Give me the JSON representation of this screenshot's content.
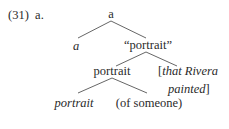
{
  "example": {
    "number": "(31)",
    "sub_label": "a."
  },
  "tree": {
    "root": {
      "label": "a",
      "italic": false
    },
    "level1": {
      "left": {
        "label": "a",
        "italic": true
      },
      "right": {
        "label": "“portrait”",
        "italic": false
      }
    },
    "level2": {
      "left": {
        "label": "portrait",
        "italic": false
      },
      "right": {
        "line1_open": "[",
        "line1": "that Rivera",
        "line2": "painted",
        "line2_close": "]",
        "italic": true
      }
    },
    "level3": {
      "left": {
        "label": "portrait",
        "italic": true
      },
      "right": {
        "label": "(of someone)",
        "italic": false
      }
    }
  }
}
